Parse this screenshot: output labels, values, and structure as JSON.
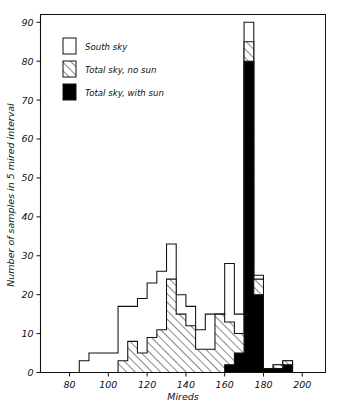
{
  "figure": {
    "background_color": "#ffffff",
    "ink_color": "#111111"
  },
  "axes": {
    "x": {
      "title": "Mireds",
      "ticks": [
        80,
        100,
        120,
        140,
        160,
        180,
        200
      ],
      "tick_labels": [
        "80",
        "100",
        "120",
        "140",
        "160",
        "180",
        "200"
      ],
      "range": [
        65,
        212
      ]
    },
    "y": {
      "title": "Number of samples in 5 mired interval",
      "ticks": [
        0,
        10,
        20,
        30,
        40,
        50,
        60,
        70,
        80,
        90
      ],
      "tick_labels": [
        "0",
        "10",
        "20",
        "30",
        "40",
        "50",
        "60",
        "70",
        "80",
        "90"
      ],
      "range": [
        0,
        92
      ]
    }
  },
  "legend": {
    "position": "upper-left",
    "items": [
      {
        "label": "South sky",
        "swatch": "white",
        "fill_color": "#ffffff"
      },
      {
        "label": "Total sky, no sun",
        "swatch": "hatched",
        "fill_color": "#ffffff"
      },
      {
        "label": "Total sky, with sun",
        "swatch": "solid",
        "fill_color": "#000000"
      }
    ]
  },
  "chart_data": {
    "type": "bar",
    "subtype": "overlaid step histogram",
    "title": "",
    "xlabel": "Mireds",
    "ylabel": "Number of samples in 5 mired interval",
    "xlim": [
      65,
      212
    ],
    "ylim": [
      0,
      92
    ],
    "bin_width": 5,
    "grid": false,
    "legend_position": "upper-left",
    "bin_starts": [
      65,
      70,
      75,
      80,
      85,
      90,
      95,
      100,
      105,
      110,
      115,
      120,
      125,
      130,
      135,
      140,
      145,
      150,
      155,
      160,
      165,
      170,
      175,
      180,
      185,
      190,
      195,
      200,
      205
    ],
    "series": [
      {
        "name": "South sky",
        "style": "white-outline",
        "values": [
          0,
          0,
          0,
          0,
          3,
          5,
          5,
          5,
          17,
          17,
          19,
          23,
          26,
          33,
          20,
          17,
          11,
          15,
          15,
          28,
          15,
          90,
          25,
          1,
          2,
          3,
          0,
          0,
          0
        ]
      },
      {
        "name": "Total sky, no sun",
        "style": "hatched",
        "values": [
          0,
          0,
          0,
          0,
          0,
          0,
          0,
          0,
          3,
          8,
          5,
          9,
          11,
          24,
          15,
          12,
          6,
          6,
          15,
          13,
          10,
          85,
          24,
          1,
          2,
          3,
          0,
          0,
          0
        ]
      },
      {
        "name": "Total sky, with sun",
        "style": "solid-black",
        "values": [
          0,
          0,
          0,
          0,
          0,
          0,
          0,
          0,
          0,
          0,
          0,
          0,
          0,
          0,
          0,
          0,
          0,
          0,
          0,
          2,
          5,
          80,
          20,
          1,
          1,
          2,
          0,
          0,
          0
        ]
      }
    ]
  }
}
